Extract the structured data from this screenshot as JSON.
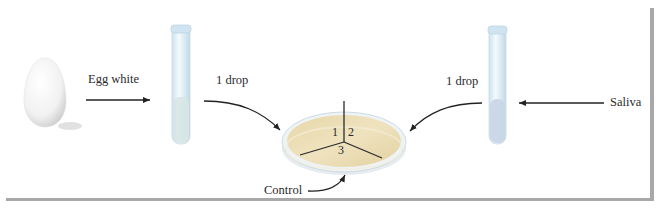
{
  "figure": {
    "labels": {
      "egg_white": "Egg white",
      "drop_left": "1 drop",
      "drop_right": "1 drop",
      "saliva": "Saliva",
      "control": "Control"
    },
    "plate_sections": [
      "1",
      "2",
      "3"
    ],
    "items": {
      "egg": "egg",
      "tube_left": "test tube with egg white",
      "tube_right": "test tube with saliva",
      "plate": "petri dish divided into 3 sections"
    },
    "colors": {
      "agar": "#e8d9ae",
      "tube_glass": "#dcecf5",
      "tube_liquid_left": "#d6e6e4",
      "tube_liquid_right": "#c9d6e6",
      "arrow": "#222222",
      "frame_shadow": "#9a9a9a"
    }
  }
}
